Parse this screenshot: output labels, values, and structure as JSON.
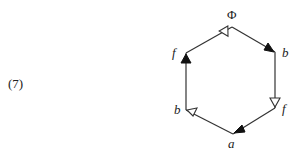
{
  "equation_number": "(7)",
  "diagram": {
    "type": "hexagon-graph",
    "vertices": [
      {
        "id": "top",
        "label": "Φ",
        "x": 232,
        "y": 27
      },
      {
        "id": "right-top",
        "label": "b",
        "x": 275,
        "y": 52
      },
      {
        "id": "right-bottom",
        "label": "f",
        "x": 275,
        "y": 108
      },
      {
        "id": "bottom",
        "label": "a",
        "x": 233,
        "y": 134
      },
      {
        "id": "left-bottom",
        "label": "b",
        "x": 186,
        "y": 110
      },
      {
        "id": "left-top",
        "label": "f",
        "x": 186,
        "y": 53
      }
    ],
    "edges": [
      {
        "from": "left-top",
        "to": "top",
        "arrow": "hollow"
      },
      {
        "from": "top",
        "to": "right-top",
        "arrow": "filled"
      },
      {
        "from": "right-top",
        "to": "right-bottom",
        "arrow": "hollow"
      },
      {
        "from": "right-bottom",
        "to": "bottom",
        "arrow": "filled"
      },
      {
        "from": "bottom",
        "to": "left-bottom",
        "arrow": "hollow"
      },
      {
        "from": "left-bottom",
        "to": "left-top",
        "arrow": "filled"
      }
    ],
    "colors": {
      "line": "#333333",
      "text": "#222222"
    }
  }
}
